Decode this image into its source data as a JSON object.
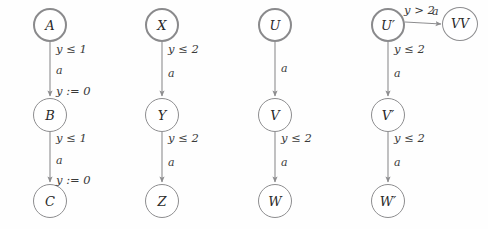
{
  "figure": {
    "background_color": "#fefefe",
    "stroke_color": "#8d8d8f",
    "text_color": "#2a2a2a",
    "columns": [
      {
        "name": "column-1",
        "nodes": [
          {
            "id": "A",
            "label": "A",
            "initial": true,
            "x": 50,
            "y": 25
          },
          {
            "id": "B",
            "label": "B",
            "initial": false,
            "x": 50,
            "y": 115
          },
          {
            "id": "C",
            "label": "C",
            "initial": false,
            "x": 50,
            "y": 201
          }
        ],
        "edges": [
          {
            "from": "A",
            "to": "B",
            "guard": "y ≤ 1",
            "action": "a",
            "reset": "y := 0"
          },
          {
            "from": "B",
            "to": "C",
            "guard": "y ≤ 1",
            "action": "a",
            "reset": "y := 0"
          }
        ]
      },
      {
        "name": "column-2",
        "nodes": [
          {
            "id": "X",
            "label": "X",
            "initial": true,
            "x": 162,
            "y": 25
          },
          {
            "id": "Y",
            "label": "Y",
            "initial": false,
            "x": 162,
            "y": 115
          },
          {
            "id": "Z",
            "label": "Z",
            "initial": false,
            "x": 162,
            "y": 201
          }
        ],
        "edges": [
          {
            "from": "X",
            "to": "Y",
            "guard": "y ≤ 2",
            "action": "a",
            "reset": ""
          },
          {
            "from": "Y",
            "to": "Z",
            "guard": "y ≤ 2",
            "action": "a",
            "reset": ""
          }
        ]
      },
      {
        "name": "column-3",
        "nodes": [
          {
            "id": "U",
            "label": "U",
            "initial": true,
            "x": 275,
            "y": 25
          },
          {
            "id": "V",
            "label": "V",
            "initial": false,
            "x": 275,
            "y": 115
          },
          {
            "id": "W",
            "label": "W",
            "initial": false,
            "x": 275,
            "y": 201
          }
        ],
        "edges": [
          {
            "from": "U",
            "to": "V",
            "guard": "",
            "action": "a",
            "reset": ""
          },
          {
            "from": "V",
            "to": "W",
            "guard": "y ≤ 2",
            "action": "a",
            "reset": ""
          }
        ]
      },
      {
        "name": "column-4",
        "nodes": [
          {
            "id": "Up",
            "label": "U′",
            "initial": true,
            "x": 388,
            "y": 25
          },
          {
            "id": "Vp",
            "label": "V′",
            "initial": false,
            "x": 388,
            "y": 115
          },
          {
            "id": "Wp",
            "label": "W′",
            "initial": false,
            "x": 388,
            "y": 201
          },
          {
            "id": "VV",
            "label": "VV",
            "initial": false,
            "x": 460,
            "y": 25
          }
        ],
        "edges": [
          {
            "from": "Up",
            "to": "Vp",
            "guard": "y ≤ 2",
            "action": "a",
            "reset": ""
          },
          {
            "from": "Vp",
            "to": "Wp",
            "guard": "y ≤ 2",
            "action": "a",
            "reset": ""
          },
          {
            "from": "Up",
            "to": "VV",
            "guard": "y > 2",
            "action": "a",
            "reset": ""
          }
        ]
      }
    ],
    "labels": {
      "c1e1_guard": "y ≤ 1",
      "c1e1_action": "a",
      "c1e1_reset": "y := 0",
      "c1e2_guard": "y ≤ 1",
      "c1e2_action": "a",
      "c1e2_reset": "y := 0",
      "c2e1_guard": "y ≤ 2",
      "c2e1_action": "a",
      "c2e2_guard": "y ≤ 2",
      "c2e2_action": "a",
      "c3e1_action": "a",
      "c3e2_guard": "y ≤ 2",
      "c3e2_action": "a",
      "c4e1_guard": "y ≤ 2",
      "c4e1_action": "a",
      "c4e2_guard": "y ≤ 2",
      "c4e2_action": "a",
      "c4e3_guard": "y > 2",
      "c4e3_action": "a"
    },
    "node_labels": {
      "A": "A",
      "B": "B",
      "C": "C",
      "X": "X",
      "Y": "Y",
      "Z": "Z",
      "U": "U",
      "V": "V",
      "W": "W",
      "Up": "U′",
      "Vp": "V′",
      "Wp": "W′",
      "VV": "VV"
    }
  }
}
